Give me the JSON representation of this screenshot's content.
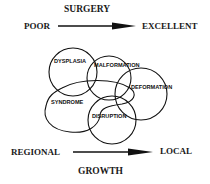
{
  "top_axis": {
    "label": "SURGERY",
    "left": "POOR",
    "right": "EXCELLENT"
  },
  "bottom_axis": {
    "label": "GROWTH",
    "left": "REGIONAL",
    "right": "LOCAL"
  },
  "sets": [
    {
      "name": "DYSPLASIA",
      "shape": "circle"
    },
    {
      "name": "MALFORMATION",
      "shape": "circle"
    },
    {
      "name": "DEFORMATION",
      "shape": "circle"
    },
    {
      "name": "DISRUPTION",
      "shape": "circle"
    },
    {
      "name": "SYNDROME",
      "shape": "blob"
    }
  ],
  "colors": {
    "ink": "#111111",
    "background": "#ffffff"
  }
}
